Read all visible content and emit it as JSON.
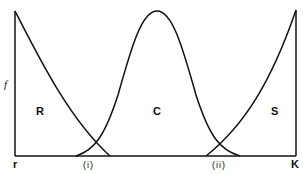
{
  "diagram": {
    "y_axis_label": "f",
    "x_axis": {
      "left_label": "r",
      "right_label": "K",
      "intersection_labels": [
        "(i)",
        "(ii)"
      ]
    },
    "regions": [
      {
        "id": "R",
        "label": "R"
      },
      {
        "id": "C",
        "label": "C"
      },
      {
        "id": "S",
        "label": "S"
      }
    ],
    "curves": [
      {
        "name": "R-curve",
        "shape": "decreasing from top-left to baseline"
      },
      {
        "name": "C-curve",
        "shape": "bell-shaped, peak near centre"
      },
      {
        "name": "S-curve",
        "shape": "increasing from baseline to top-right"
      }
    ],
    "colors": {
      "line": "#111111",
      "background": "#ffffff"
    }
  }
}
